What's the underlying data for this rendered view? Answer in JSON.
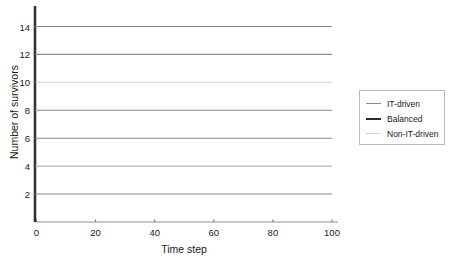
{
  "chart_data": {
    "type": "line",
    "title": "",
    "xlabel": "Time step",
    "ylabel": "Number of survivors",
    "xlim": [
      0,
      100
    ],
    "ylim": [
      0,
      15
    ],
    "xticks": [
      0,
      20,
      40,
      60,
      80,
      100
    ],
    "yticks": [
      2,
      4,
      6,
      8,
      10,
      12,
      14
    ],
    "grid": false,
    "legend_position": "right",
    "x": [
      0,
      100
    ],
    "series": [
      {
        "name": "IT-driven",
        "color": "#8a8a8a",
        "width": 1.1,
        "values": [
          14,
          14
        ],
        "level": 14
      },
      {
        "name": "IT-driven",
        "color": "#8a8a8a",
        "width": 1.1,
        "values": [
          12,
          12
        ],
        "level": 12
      },
      {
        "name": "Non-IT-driven",
        "color": "#dcdcdc",
        "width": 1.1,
        "values": [
          10,
          10
        ],
        "level": 10
      },
      {
        "name": "Balanced",
        "color": "#8a8a8a",
        "width": 1.1,
        "values": [
          8,
          8
        ],
        "level": 8
      },
      {
        "name": "IT-driven",
        "color": "#8a8a8a",
        "width": 1.1,
        "values": [
          6,
          6
        ],
        "level": 6
      },
      {
        "name": "Non-IT-driven",
        "color": "#b5b5b5",
        "width": 1.1,
        "values": [
          4,
          4
        ],
        "level": 4
      },
      {
        "name": "Balanced",
        "color": "#8a8a8a",
        "width": 1.1,
        "values": [
          2,
          2
        ],
        "level": 2
      }
    ],
    "legend_entries": [
      {
        "label": "IT-driven",
        "color": "#8a8a8a",
        "width": 1.4
      },
      {
        "label": "Balanced",
        "color": "#2b2b2b",
        "width": 2.0
      },
      {
        "label": "Non-IT-driven",
        "color": "#d2d2d2",
        "width": 1.2
      }
    ],
    "axis_colors": {
      "yaxis_spine": "#333333",
      "xaxis_spine": "#8f8f8f",
      "tick_mark": "#6d6d6d"
    }
  }
}
